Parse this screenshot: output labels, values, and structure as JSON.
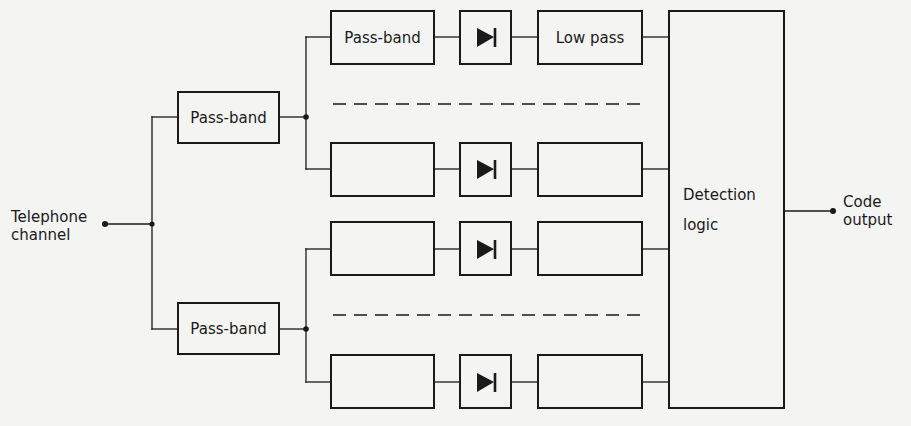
{
  "diagram": {
    "type": "block-diagram",
    "colors": {
      "background": "#f4f4f2",
      "ink": "#1a1a1a"
    },
    "input": {
      "label_line1": "Telephone",
      "label_line2": "channel"
    },
    "output": {
      "label_line1": "Code",
      "label_line2": "output"
    },
    "first_stage": [
      {
        "label": "Pass-band"
      },
      {
        "label": "Pass-band"
      }
    ],
    "channels": [
      {
        "filter_label": "Pass-band",
        "rectifier_icon": "diode-icon",
        "lowpass_label": "Low pass"
      },
      {
        "filter_label": "",
        "rectifier_icon": "diode-icon",
        "lowpass_label": ""
      },
      {
        "filter_label": "",
        "rectifier_icon": "diode-icon",
        "lowpass_label": ""
      },
      {
        "filter_label": "",
        "rectifier_icon": "diode-icon",
        "lowpass_label": ""
      }
    ],
    "logic": {
      "label_line1": "Detection",
      "label_line2": "logic"
    },
    "omitted_channels_marker": "dashed-line"
  }
}
